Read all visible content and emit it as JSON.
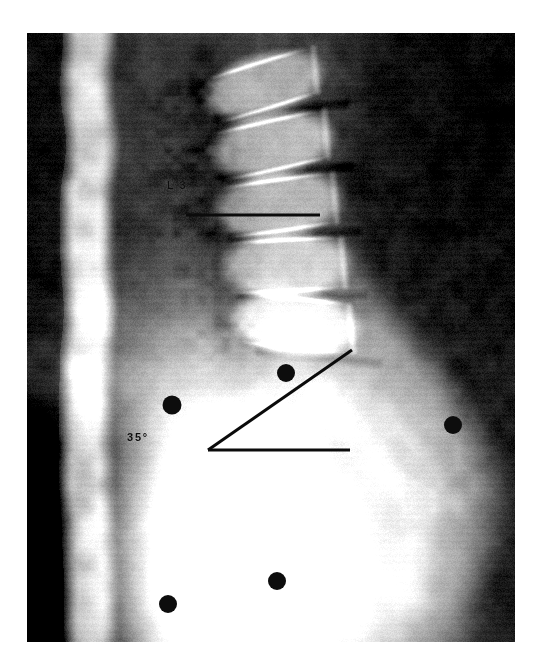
{
  "figure": {
    "kind": "radiograph",
    "modality_view": "lateral lumbosacral spine radiograph",
    "plate": {
      "x": 27,
      "y": 33,
      "width": 488,
      "height": 609,
      "background_color": "#0a0a0a",
      "page_background": "#ffffff"
    },
    "annotations": {
      "vertebra_label": {
        "text": "L 3",
        "x": 140,
        "y": 146,
        "color": "#0d0d0d",
        "font_size": 11
      },
      "angle_label": {
        "text": "35°",
        "x": 100,
        "y": 398,
        "color": "#0d0d0d",
        "font_size": 11
      },
      "endplate_line": {
        "name": "l3-inferior-endplate-line",
        "x1": 159,
        "y1": 182,
        "x2": 293,
        "y2": 182,
        "color": "#0b0b0b",
        "stroke_width": 3.2
      },
      "angle_horizontal_ray": {
        "name": "horizontal-reference-ray",
        "x1": 181,
        "y1": 417,
        "x2": 323,
        "y2": 417,
        "color": "#0b0b0b",
        "stroke_width": 3.0
      },
      "angle_oblique_ray": {
        "name": "sacral-inclination-ray",
        "x1": 181,
        "y1": 417,
        "x2": 325,
        "y2": 317,
        "color": "#0b0b0b",
        "stroke_width": 3.0
      }
    },
    "radiopaque_markers": {
      "name": "radiopaque-skin-markers",
      "color": "#0d0d0d",
      "items": [
        {
          "id": "marker-1",
          "cx": 145,
          "cy": 372,
          "r": 9.5
        },
        {
          "id": "marker-2",
          "cx": 259,
          "cy": 340,
          "r": 9.0
        },
        {
          "id": "marker-3",
          "cx": 426,
          "cy": 392,
          "r": 9.0
        },
        {
          "id": "marker-4",
          "cx": 250,
          "cy": 548,
          "r": 9.0
        },
        {
          "id": "marker-5",
          "cx": 141,
          "cy": 571,
          "r": 9.0
        }
      ]
    },
    "chart_data": {
      "type": "scatter",
      "title": "Lateral lumbosacral radiograph with sacral inclination measurement",
      "xlabel": "",
      "ylabel": "",
      "annotations": [
        {
          "label": "L 3",
          "x": 140,
          "y": 146,
          "role": "vertebral-level-label"
        },
        {
          "label": "35°",
          "x": 100,
          "y": 398,
          "role": "measured-angle"
        }
      ],
      "measured_values": [
        {
          "name": "sacral inclination angle",
          "value": 35,
          "unit": "degrees"
        }
      ],
      "series": [
        {
          "name": "radiopaque skin markers",
          "x": [
            145,
            259,
            426,
            250,
            141
          ],
          "y": [
            372,
            340,
            392,
            548,
            571
          ]
        }
      ],
      "reference_lines": [
        {
          "name": "L3 inferior endplate line",
          "x": [
            159,
            293
          ],
          "y": [
            182,
            182
          ]
        },
        {
          "name": "horizontal reference ray",
          "x": [
            181,
            323
          ],
          "y": [
            417,
            417
          ]
        },
        {
          "name": "sacral inclination ray",
          "x": [
            181,
            325
          ],
          "y": [
            417,
            317
          ]
        }
      ],
      "grid": false,
      "legend_position": "none"
    }
  }
}
